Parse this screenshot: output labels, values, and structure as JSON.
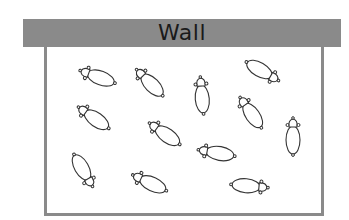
{
  "diagram": {
    "wall_label": "Wall",
    "colors": {
      "wall": "#8a8a8a",
      "pen_border": "#8a8a8a",
      "sheep_outline": "#333333",
      "background": "#ffffff"
    },
    "sheep": [
      {
        "id": 1,
        "x": 98,
        "y": 77,
        "heading": 200
      },
      {
        "id": 2,
        "x": 150,
        "y": 83,
        "heading": 225
      },
      {
        "id": 3,
        "x": 202,
        "y": 96,
        "heading": 265
      },
      {
        "id": 4,
        "x": 262,
        "y": 71,
        "heading": 30
      },
      {
        "id": 5,
        "x": 94,
        "y": 118,
        "heading": 215
      },
      {
        "id": 6,
        "x": 165,
        "y": 134,
        "heading": 215
      },
      {
        "id": 7,
        "x": 251,
        "y": 113,
        "heading": 235
      },
      {
        "id": 8,
        "x": 293,
        "y": 137,
        "heading": 270
      },
      {
        "id": 9,
        "x": 217,
        "y": 153,
        "heading": 190
      },
      {
        "id": 10,
        "x": 83,
        "y": 170,
        "heading": 60
      },
      {
        "id": 11,
        "x": 150,
        "y": 183,
        "heading": 205
      },
      {
        "id": 12,
        "x": 249,
        "y": 186,
        "heading": 5
      }
    ]
  }
}
